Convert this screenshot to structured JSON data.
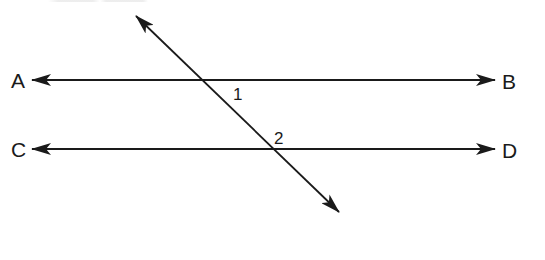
{
  "diagram": {
    "colors": {
      "line": "#1a1a1a",
      "background": "#ffffff"
    },
    "points": {
      "A": "A",
      "B": "B",
      "C": "C",
      "D": "D"
    },
    "angles": {
      "angle_1": "1",
      "angle_2": "2"
    },
    "lines": [
      {
        "name": "line-AB",
        "from": [
          32,
          80
        ],
        "to": [
          495,
          80
        ],
        "arrows": "both"
      },
      {
        "name": "line-CD",
        "from": [
          32,
          149
        ],
        "to": [
          495,
          149
        ],
        "arrows": "both"
      },
      {
        "name": "transversal",
        "from": [
          136,
          16
        ],
        "to": [
          339,
          212
        ],
        "arrows": "both"
      }
    ]
  }
}
